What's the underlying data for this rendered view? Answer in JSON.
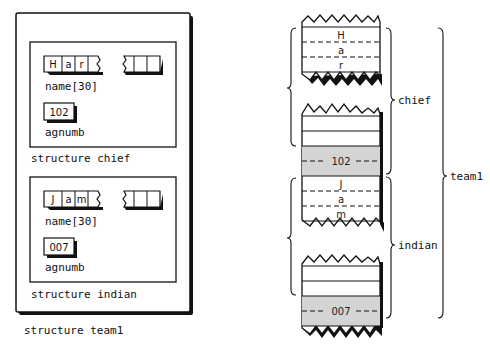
{
  "left_diagram": {
    "outer_label": "structure team1",
    "structs": [
      {
        "label": "structure chief",
        "name_chars": [
          "H",
          "a",
          "r"
        ],
        "name_field_label": "name[30]",
        "agnumb_value": "102",
        "agnumb_label": "agnumb"
      },
      {
        "label": "structure indian",
        "name_chars": [
          "J",
          "a",
          "m"
        ],
        "name_field_label": "name[30]",
        "agnumb_value": "007",
        "agnumb_label": "agnumb"
      }
    ]
  },
  "right_diagram": {
    "chief": {
      "label": "chief",
      "name_chars": [
        "H",
        "a",
        "r"
      ],
      "agnumb_value": "102"
    },
    "indian": {
      "label": "indian",
      "name_chars": [
        "J",
        "a",
        "m"
      ],
      "agnumb_value": "007"
    },
    "outer_label": "team1",
    "shade_color": "#d4d4d4"
  }
}
